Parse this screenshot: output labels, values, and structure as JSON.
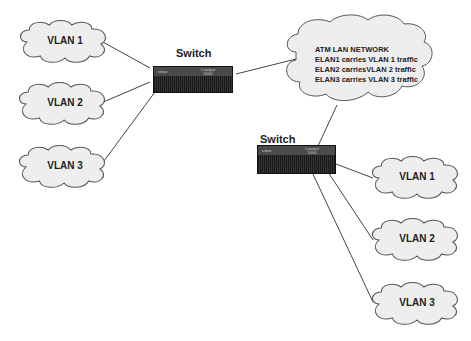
{
  "diagram": {
    "switches": [
      {
        "id": "switch-left",
        "title": "Switch",
        "logo": "cisco",
        "model_line1": "Catalyst",
        "model_line2": "5000"
      },
      {
        "id": "switch-right",
        "title": "Switch",
        "logo": "cisco",
        "model_line1": "Catalyst",
        "model_line2": "5000"
      }
    ],
    "atm_cloud": {
      "lines": [
        "ATM LAN NETWORK",
        "ELAN1 carries  VLAN 1 traffic",
        "ELAN2 carriesVLAN 2 traffic",
        "ELAN3 carries VLAN 3 traffic"
      ]
    },
    "left_vlans": [
      {
        "label": "VLAN 1"
      },
      {
        "label": "VLAN 2"
      },
      {
        "label": "VLAN 3"
      }
    ],
    "right_vlans": [
      {
        "label": "VLAN 1"
      },
      {
        "label": "VLAN 2"
      },
      {
        "label": "VLAN 3"
      }
    ],
    "colors": {
      "cloud_fill": "#eeeeee",
      "cloud_stroke": "#555555",
      "line": "#444444",
      "switch_body": "#2a2a2a"
    }
  }
}
